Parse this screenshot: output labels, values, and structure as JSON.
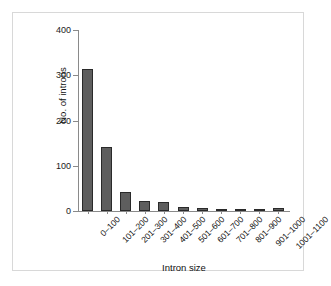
{
  "chart_data": {
    "type": "bar",
    "title": "",
    "xlabel": "Intron size",
    "ylabel": "No. of introns",
    "categories": [
      "0–100",
      "101–200",
      "201–300",
      "301–400",
      "401–500",
      "501–600",
      "601–700",
      "701–800",
      "801–900",
      "901–1000",
      "1001–1100"
    ],
    "values": [
      313,
      142,
      43,
      22,
      20,
      8,
      6,
      5,
      4,
      1,
      6
    ],
    "ylim": [
      0,
      400
    ],
    "yticks": [
      0,
      100,
      200,
      300,
      400
    ],
    "ytick_labels": [
      "0",
      "100",
      "200",
      "300",
      "400"
    ],
    "grid": false,
    "legend": null,
    "bar_color": "#5e5e5e",
    "bar_edge_color": "#2a2a2a",
    "axis_color": "#8a8a8a",
    "background": "#ffffff",
    "frame_color": "#d8d8d8"
  }
}
